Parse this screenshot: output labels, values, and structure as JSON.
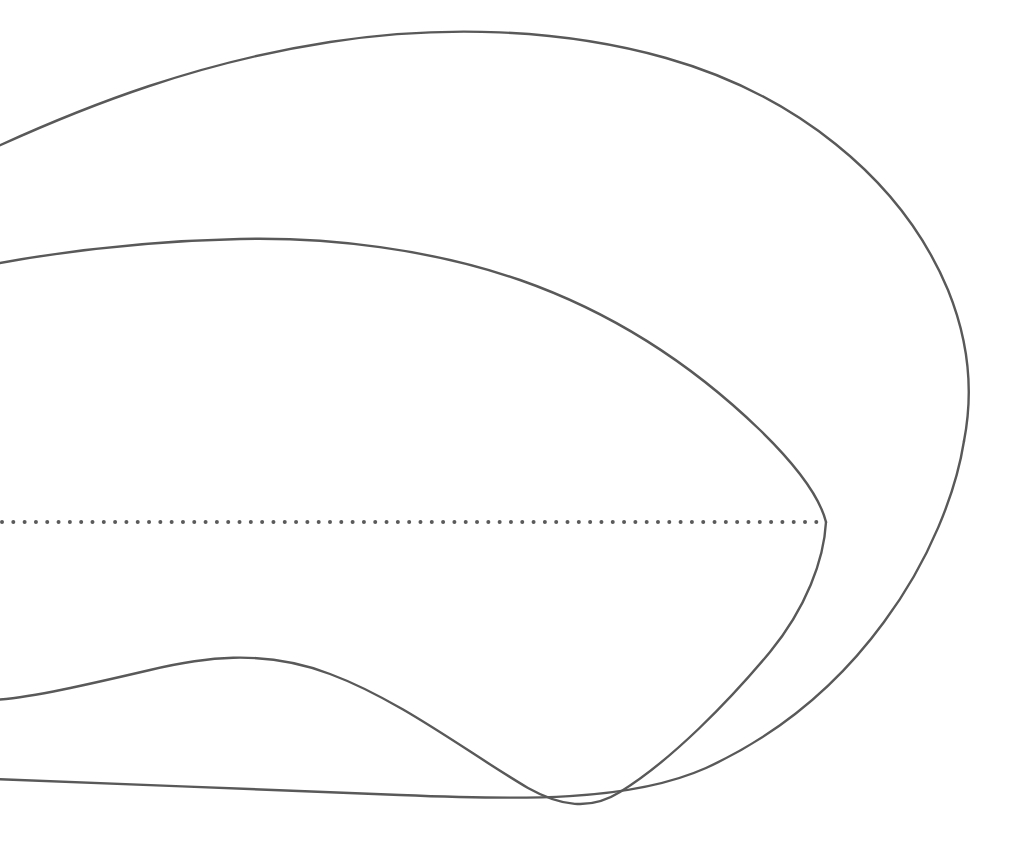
{
  "figure": {
    "background_color": "#ffffff",
    "canvas": {
      "width": 1024,
      "height": 860
    },
    "line_color": "#595959",
    "axis_color": "#5a5a5a",
    "stroke_width": 2.4,
    "axis": {
      "name": "centerline",
      "style": "dotted",
      "y": 522,
      "x_start": 2,
      "x_end": 822,
      "dot_diameter": 4,
      "dot_spacing": 11.3,
      "color": "#5a5a5a"
    },
    "curves": [
      {
        "name": "outer-contour-upper",
        "label": "Outer contour, upper branch",
        "stroke": "#595959",
        "stroke_width": 2.4,
        "d": "M -6,148 C 90,104 200,62 330,42 C 440,25 560,28 666,58 C 790,93 900,175 948,290 C 972,349 972,400 964,441"
      },
      {
        "name": "outer-contour-lower",
        "label": "Outer contour, lower branch",
        "stroke": "#595959",
        "stroke_width": 2.4,
        "d": "M 964,441 C 956,492 930,560 884,622 C 840,682 780,734 706,768 C 630,802 520,800 400,795 C 280,790 120,784 -6,779"
      },
      {
        "name": "inner-contour-upper",
        "label": "Inner contour, upper branch",
        "stroke": "#595959",
        "stroke_width": 2.4,
        "d": "M -6,264 C 70,250 150,241 240,239 C 330,237 430,249 520,280 C 620,315 700,372 760,430 C 800,469 820,498 826,522"
      },
      {
        "name": "inner-contour-lower",
        "label": "Inner contour, lower branch",
        "stroke": "#595959",
        "stroke_width": 2.4,
        "d": "M 826,522 C 824,560 806,608 770,652 C 730,700 672,760 620,792 C 590,811 560,806 528,788 C 470,754 400,700 330,674 C 262,648 200,658 150,670 C 90,684 30,698 -6,700"
      }
    ],
    "geometry_notes": {
      "outer_rightmost_point": {
        "x": 965,
        "y": 441
      },
      "outer_apex_point": {
        "x": 510,
        "y": 38
      },
      "inner_rightmost_point": {
        "x": 826,
        "y": 522
      },
      "inner_apex_point": {
        "x": 265,
        "y": 239
      },
      "lower_crossing_point": {
        "x": 530,
        "y": 789
      },
      "inner_lower_hump_peak": {
        "x": 195,
        "y": 660
      },
      "left_edge_intercepts": [
        148,
        264,
        700,
        779
      ]
    }
  }
}
